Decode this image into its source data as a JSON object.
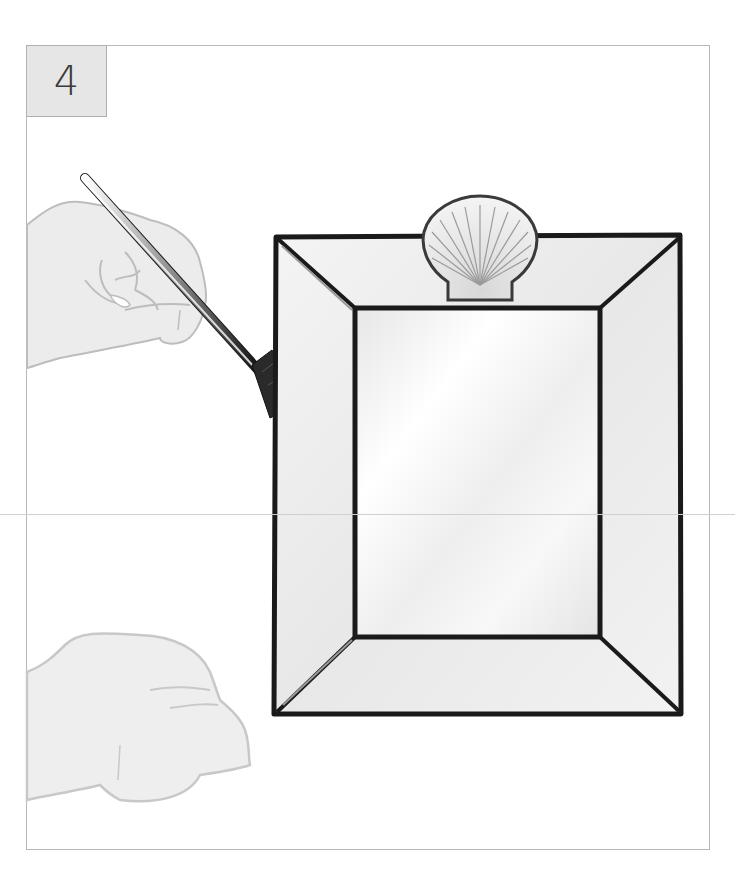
{
  "illustration": {
    "step_number": "4",
    "description": "Hand holding a brush applying to a mirror frame with scallop shell ornament",
    "elements": [
      "step-number-box",
      "hand-holding-brush",
      "paint-brush",
      "mirror-frame",
      "mirror-glass",
      "scallop-shell",
      "resting-hand"
    ],
    "colors": {
      "step_box_fill": "#e6e6e6",
      "frame_stroke": "#1a1a1a",
      "hand_fill": "#ececec",
      "hand_stroke": "#bdbdbd",
      "glass_fill": "#f2f2f2"
    }
  }
}
